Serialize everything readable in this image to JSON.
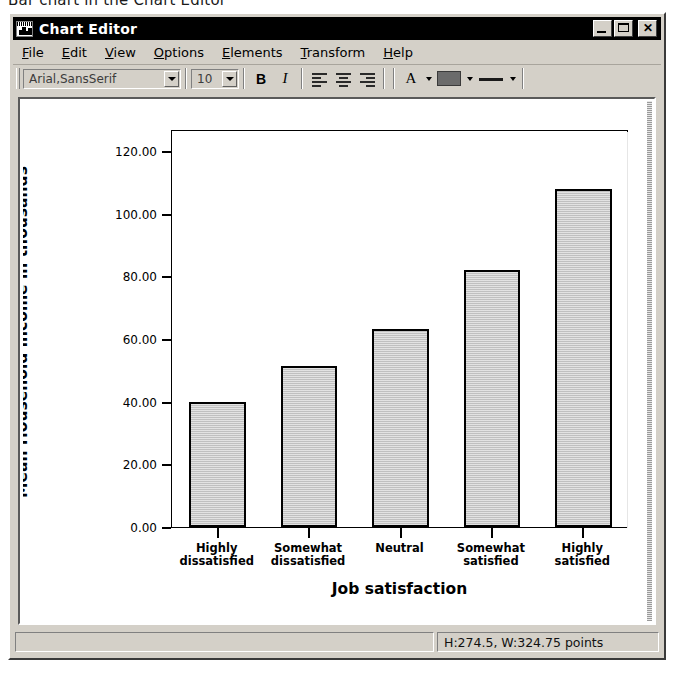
{
  "caption": "Bar chart in the Chart Editor",
  "window": {
    "title": "Chart Editor",
    "icon": "chart-window-icon",
    "controls": {
      "minimize": "_",
      "maximize": "□",
      "close": "✕"
    }
  },
  "menubar": {
    "items": [
      {
        "label": "File",
        "accel": "F"
      },
      {
        "label": "Edit",
        "accel": "E"
      },
      {
        "label": "View",
        "accel": "V"
      },
      {
        "label": "Options",
        "accel": "O"
      },
      {
        "label": "Elements",
        "accel": "E"
      },
      {
        "label": "Transform",
        "accel": "T"
      },
      {
        "label": "Help",
        "accel": "H"
      }
    ]
  },
  "toolbar": {
    "font_family_value": "Arial,SansSerif",
    "font_size_value": "10",
    "bold_label": "B",
    "italic_label": "I",
    "text_color_label": "A",
    "fill_color_hex": "#6b6b6b",
    "icons": [
      "align-left-icon",
      "align-center-icon",
      "align-right-icon",
      "text-color-icon",
      "fill-color-icon",
      "line-style-icon"
    ]
  },
  "statusbar": {
    "message": "",
    "size_readout": "H:274.5, W:324.75 points"
  },
  "chart_data": {
    "type": "bar",
    "title": "",
    "xlabel": "Job satisfaction",
    "ylabel": "Mean Household income in thousands",
    "categories": [
      "Highly\ndissatisfied",
      "Somewhat\ndissatisfied",
      "Neutral",
      "Somewhat\nsatisfied",
      "Highly\nsatisfied"
    ],
    "category_lines": [
      [
        "Highly",
        "dissatisfied"
      ],
      [
        "Somewhat",
        "dissatisfied"
      ],
      [
        "Neutral",
        ""
      ],
      [
        "Somewhat",
        "satisfied"
      ],
      [
        "Highly",
        "satisfied"
      ]
    ],
    "values": [
      40.0,
      51.3,
      63.2,
      82.0,
      108.0
    ],
    "ylim": [
      0,
      127
    ],
    "yticks": [
      0,
      20,
      40,
      60,
      80,
      100,
      120
    ],
    "ytick_labels": [
      "0.00",
      "20.00",
      "40.00",
      "60.00",
      "80.00",
      "100.00",
      "120.00"
    ],
    "grid": false,
    "legend": null,
    "bar_fill_hex": "#c0c0c0",
    "bar_border_hex": "#000000"
  }
}
